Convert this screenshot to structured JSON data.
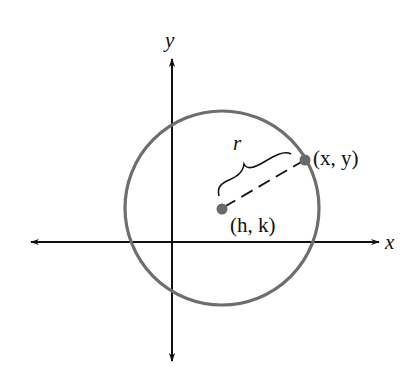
{
  "diagram": {
    "axes": {
      "x_label": "x",
      "y_label": "y"
    },
    "circle": {
      "center_label": "(h, k)",
      "point_label": "(x, y)",
      "radius_label": "r",
      "stroke_color": "#6e6e6e"
    },
    "colors": {
      "axis": "#111111",
      "points": "#6a6a6a",
      "background": "#ffffff"
    }
  }
}
